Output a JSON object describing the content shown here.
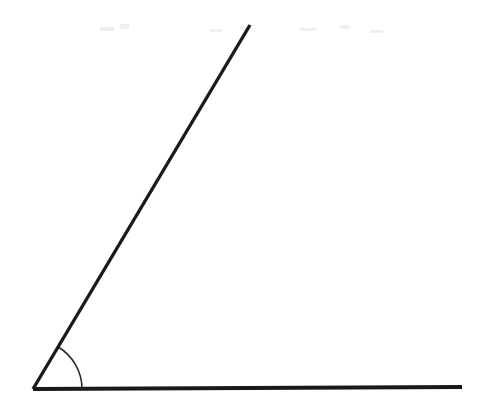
{
  "figure": {
    "name": "acute-angle-diagram",
    "background_color": "#ffffff",
    "stroke_color": "#1a1a1a",
    "arc_color": "#2a2a2a",
    "canvas": {
      "width": 500,
      "height": 399
    },
    "vertex": {
      "x": 33,
      "y": 389
    },
    "rays": [
      {
        "name": "horizontal-ray",
        "from": {
          "x": 33,
          "y": 389
        },
        "to": {
          "x": 462,
          "y": 387
        },
        "thickness": 4,
        "direction_degrees": 0
      },
      {
        "name": "slanted-ray",
        "from": {
          "x": 33,
          "y": 389
        },
        "to": {
          "x": 250,
          "y": 25
        },
        "thickness": 3.4,
        "direction_degrees": 59
      }
    ],
    "angle_arc": {
      "name": "angle-arc",
      "radius": 49,
      "start_degrees": 0,
      "end_degrees": 59,
      "thickness": 1.6,
      "start_point": {
        "x": 82,
        "y": 388
      },
      "end_point": {
        "x": 58,
        "y": 346
      }
    },
    "scan_artifacts": [
      {
        "x": 100,
        "y": 27,
        "width": 14,
        "height": 4
      },
      {
        "x": 120,
        "y": 24,
        "width": 9,
        "height": 5
      },
      {
        "x": 210,
        "y": 29,
        "width": 12,
        "height": 3
      },
      {
        "x": 240,
        "y": 26,
        "width": 8,
        "height": 4
      },
      {
        "x": 300,
        "y": 28,
        "width": 16,
        "height": 3
      },
      {
        "x": 340,
        "y": 25,
        "width": 10,
        "height": 4
      },
      {
        "x": 370,
        "y": 30,
        "width": 13,
        "height": 3
      }
    ]
  }
}
